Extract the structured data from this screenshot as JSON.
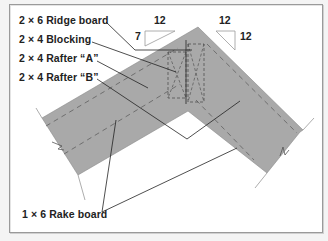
{
  "diagram": {
    "type": "roof rake framing detail",
    "labels": [
      {
        "id": "ridge",
        "text": "2 × 6 Ridge board"
      },
      {
        "id": "blocking",
        "text": "2 × 4 Blocking"
      },
      {
        "id": "rafter_a",
        "text": "2 × 4 Rafter “A”"
      },
      {
        "id": "rafter_b",
        "text": "2 × 4 Rafter “B”"
      },
      {
        "id": "rake",
        "text": "1 × 6 Rake board"
      }
    ],
    "pitch_left": {
      "rise": "7",
      "run": "12"
    },
    "pitch_right": {
      "rise": "12",
      "run": "12"
    },
    "colors": {
      "roof_fill": "#a9a9a9",
      "line": "#333333",
      "dash": "#555555",
      "triangle_stroke": "#9a9a9a"
    }
  }
}
